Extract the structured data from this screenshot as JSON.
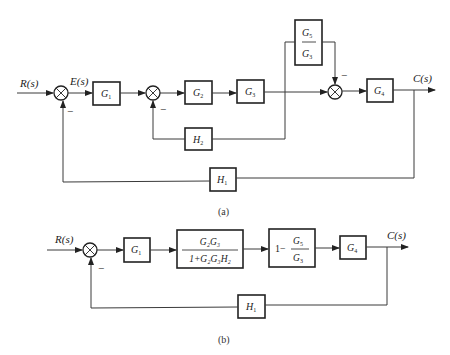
{
  "diagram_a": {
    "caption": "(a)",
    "input_label": "R(s)",
    "error_label": "E(s)",
    "output_label": "C(s)",
    "blocks": {
      "g1": {
        "base": "G",
        "sub": "1"
      },
      "g2": {
        "base": "G",
        "sub": "2"
      },
      "g3": {
        "base": "G",
        "sub": "3"
      },
      "g4": {
        "base": "G",
        "sub": "4"
      },
      "g5_over_g3": {
        "num_base": "G",
        "num_sub": "5",
        "den_base": "G",
        "den_sub": "3"
      },
      "h2": {
        "base": "H",
        "sub": "2"
      },
      "h1": {
        "base": "H",
        "sub": "1"
      }
    },
    "signs": {
      "sum1_feedback": "−",
      "sum2_feedback": "−",
      "sum3_feedforward": "−"
    }
  },
  "diagram_b": {
    "caption": "(b)",
    "input_label": "R(s)",
    "output_label": "C(s)",
    "blocks": {
      "g1": {
        "base": "G",
        "sub": "1"
      },
      "inner_loop": {
        "num": "G₂G₃",
        "den": "1+G₂G₃H₂"
      },
      "feedforward": {
        "prefix": "1−",
        "num_base": "G",
        "num_sub": "5",
        "den_base": "G",
        "den_sub": "3"
      },
      "g4": {
        "base": "G",
        "sub": "4"
      },
      "h1": {
        "base": "H",
        "sub": "1"
      }
    },
    "signs": {
      "sum_feedback": "−"
    }
  }
}
